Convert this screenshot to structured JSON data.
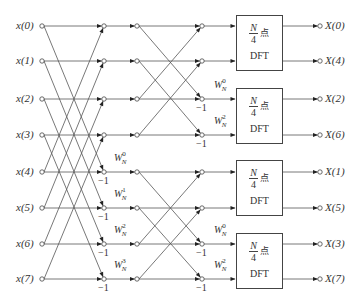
{
  "diagram": {
    "type": "radix-4 style DIF FFT flow graph (N=8)",
    "colors": {
      "line": "#444444",
      "text": "#333333",
      "background": "#ffffff"
    },
    "inputs": [
      "x(0)",
      "x(1)",
      "x(2)",
      "x(3)",
      "x(4)",
      "x(5)",
      "x(6)",
      "x(7)"
    ],
    "outputs": [
      "X(0)",
      "X(4)",
      "X(2)",
      "X(6)",
      "X(1)",
      "X(5)",
      "X(3)",
      "X(7)"
    ],
    "stage1": {
      "twiddles": [
        {
          "row": 4,
          "base": "W",
          "sub": "N",
          "sup": "0"
        },
        {
          "row": 5,
          "base": "W",
          "sub": "N",
          "sup": "1"
        },
        {
          "row": 6,
          "base": "W",
          "sub": "N",
          "sup": "2"
        },
        {
          "row": 7,
          "base": "W",
          "sub": "N",
          "sup": "3"
        }
      ],
      "neg_labels": [
        {
          "row": 4,
          "text": "−1"
        },
        {
          "row": 5,
          "text": "−1"
        },
        {
          "row": 6,
          "text": "−1"
        },
        {
          "row": 7,
          "text": "−1"
        }
      ]
    },
    "stage2": {
      "twiddles": [
        {
          "row": 2,
          "base": "W",
          "sub": "N",
          "sup": "0"
        },
        {
          "row": 3,
          "base": "W",
          "sub": "N",
          "sup": "2"
        },
        {
          "row": 6,
          "base": "W",
          "sub": "N",
          "sup": "0"
        },
        {
          "row": 7,
          "base": "W",
          "sub": "N",
          "sup": "2"
        }
      ],
      "neg_labels": [
        {
          "row": 2,
          "text": "−1"
        },
        {
          "row": 3,
          "text": "−1"
        },
        {
          "row": 6,
          "text": "−1"
        },
        {
          "row": 7,
          "text": "−1"
        }
      ]
    },
    "dft_blocks": [
      {
        "numerator": "N",
        "denominator": "4",
        "suffix": "点",
        "label": "DFT"
      },
      {
        "numerator": "N",
        "denominator": "4",
        "suffix": "点",
        "label": "DFT"
      },
      {
        "numerator": "N",
        "denominator": "4",
        "suffix": "点",
        "label": "DFT"
      },
      {
        "numerator": "N",
        "denominator": "4",
        "suffix": "点",
        "label": "DFT"
      }
    ]
  }
}
